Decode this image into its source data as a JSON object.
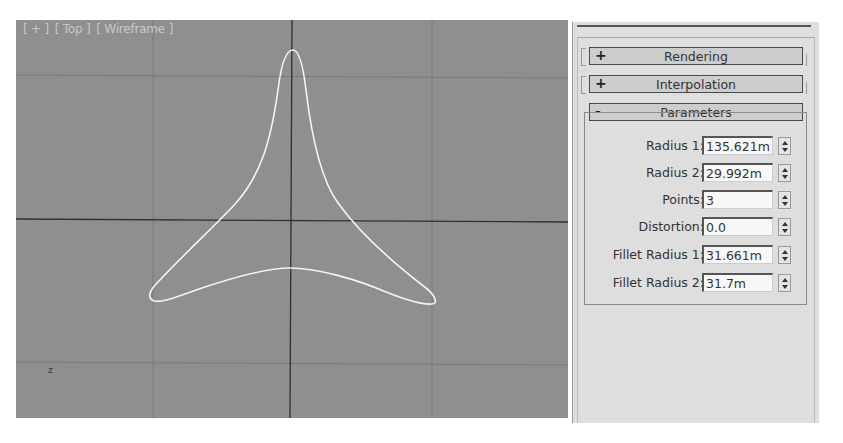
{
  "viewport": {
    "label_parts": [
      "[ + ]",
      "[ Top ]",
      "[ Wireframe ]"
    ],
    "axis_hint": "z",
    "background_color": "#8f8f8f",
    "grid_color": "#7a7a7a",
    "axis_color": "#2f2f2f",
    "shape_color": "#f4f4f4",
    "shape": {
      "type": "star",
      "points": 3,
      "tips": [
        [
          277,
          30
        ],
        [
          136,
          280
        ],
        [
          416,
          283
        ]
      ],
      "inner_arc_apex": [
        274,
        248
      ]
    }
  },
  "command_panel": {
    "rollouts": [
      {
        "sign": "+",
        "title": "Rendering",
        "expanded": false
      },
      {
        "sign": "+",
        "title": "Interpolation",
        "expanded": false
      },
      {
        "sign": "-",
        "title": "Parameters",
        "expanded": true
      }
    ],
    "parameters": [
      {
        "label": "Radius 1:",
        "value": "135.621m"
      },
      {
        "label": "Radius 2:",
        "value": "29.992m"
      },
      {
        "label": "Points:",
        "value": "3"
      },
      {
        "label": "Distortion:",
        "value": "0.0"
      },
      {
        "label": "Fillet Radius 1:",
        "value": "31.661m"
      },
      {
        "label": "Fillet Radius 2:",
        "value": "31.7m"
      }
    ]
  }
}
